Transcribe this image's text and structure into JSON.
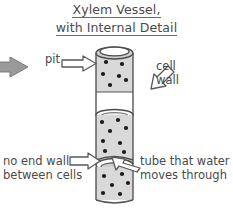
{
  "diagram": {
    "title": {
      "line1": "Xylem Vessel,",
      "line2": "with Internal Detail"
    },
    "labels": {
      "pit": "pit",
      "cell_wall_line1": "cell",
      "cell_wall_line2": "wall",
      "no_end_wall_line1": "no end wall",
      "no_end_wall_line2": "between cells",
      "tube_line1": "tube that water",
      "tube_line2": "moves through"
    },
    "colors": {
      "background": "#ffffff",
      "ink": "#4a4a4a",
      "outline": "#555555",
      "cylinder_fill": "#d9d9d9",
      "lumen_fill": "#ffffff",
      "pit_dot": "#1a1a1a",
      "arrow_fill": "#ffffff",
      "arrow_stroke": "#5a5a5a",
      "flow_arrow_fill": "#9a9a9a"
    },
    "pits": [
      {
        "x": 106,
        "y": 62
      },
      {
        "x": 122,
        "y": 64
      },
      {
        "x": 103,
        "y": 74
      },
      {
        "x": 119,
        "y": 76
      },
      {
        "x": 110,
        "y": 85
      },
      {
        "x": 126,
        "y": 80
      },
      {
        "x": 102,
        "y": 122
      },
      {
        "x": 118,
        "y": 120
      },
      {
        "x": 110,
        "y": 131
      },
      {
        "x": 126,
        "y": 128
      },
      {
        "x": 103,
        "y": 141
      },
      {
        "x": 120,
        "y": 143
      },
      {
        "x": 105,
        "y": 151
      },
      {
        "x": 124,
        "y": 152
      },
      {
        "x": 104,
        "y": 176
      },
      {
        "x": 122,
        "y": 174
      },
      {
        "x": 112,
        "y": 185
      },
      {
        "x": 128,
        "y": 183
      },
      {
        "x": 103,
        "y": 193
      },
      {
        "x": 120,
        "y": 194
      }
    ]
  }
}
